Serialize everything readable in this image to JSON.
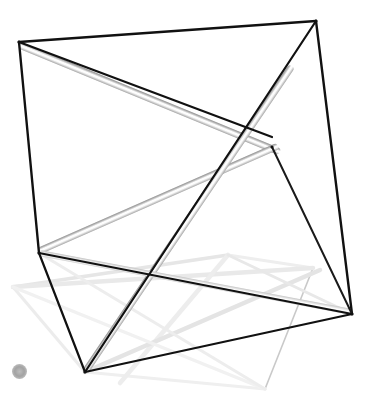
{
  "canvas": {
    "width": 381,
    "height": 417,
    "background_color": "#ffffff"
  },
  "scene": {
    "title": "3D wireframe tensegrity structure",
    "colors": {
      "edge_dark": "#111111",
      "edge_mid": "#8a8a8a",
      "strut_shadow": "#9a9a9a",
      "strut_highlight": "#ffffff",
      "edge_faint": "#e2e2e2",
      "edge_faintest": "#f0f0f0",
      "marker_gray": "#a8a8a8"
    },
    "vertices": [
      {
        "id": "v-top-left",
        "x": 19,
        "y": 42,
        "shade": "dark"
      },
      {
        "id": "v-top-right",
        "x": 316,
        "y": 21,
        "shade": "dark"
      },
      {
        "id": "v-mid-left",
        "x": 39,
        "y": 253,
        "shade": "dark"
      },
      {
        "id": "v-mid-right",
        "x": 272,
        "y": 147,
        "shade": "dark"
      },
      {
        "id": "v-bottom-left",
        "x": 85,
        "y": 372,
        "shade": "dark"
      },
      {
        "id": "v-bottom-right",
        "x": 352,
        "y": 314,
        "shade": "dark"
      },
      {
        "id": "v-ghost-left",
        "x": 13,
        "y": 287,
        "shade": "faint"
      },
      {
        "id": "v-ghost-right",
        "x": 313,
        "y": 268,
        "shade": "faint"
      },
      {
        "id": "v-ghost-bottom",
        "x": 265,
        "y": 389,
        "shade": "faint"
      },
      {
        "id": "v-ghost-upper",
        "x": 228,
        "y": 255,
        "shade": "faint"
      }
    ],
    "edges_dark": [
      {
        "id": "edge-top-rail",
        "x1": 19,
        "y1": 42,
        "x2": 316,
        "y2": 21,
        "width": 2.4,
        "color": "#111111"
      },
      {
        "id": "edge-left-post",
        "x1": 19,
        "y1": 42,
        "x2": 39,
        "y2": 253,
        "width": 2.4,
        "color": "#111111"
      },
      {
        "id": "edge-right-post",
        "x1": 316,
        "y1": 21,
        "x2": 352,
        "y2": 314,
        "width": 2.4,
        "color": "#111111"
      },
      {
        "id": "edge-top-diag-a",
        "x1": 19,
        "y1": 42,
        "x2": 272,
        "y2": 137,
        "width": 2.2,
        "color": "#111111"
      },
      {
        "id": "edge-top-diag-b",
        "x1": 316,
        "y1": 21,
        "x2": 85,
        "y2": 372,
        "width": 2.2,
        "color": "#111111"
      },
      {
        "id": "edge-left-lower",
        "x1": 39,
        "y1": 253,
        "x2": 85,
        "y2": 372,
        "width": 2.2,
        "color": "#111111"
      },
      {
        "id": "edge-bottom-rail",
        "x1": 85,
        "y1": 372,
        "x2": 352,
        "y2": 314,
        "width": 2.2,
        "color": "#111111"
      },
      {
        "id": "edge-mid-span",
        "x1": 39,
        "y1": 253,
        "x2": 352,
        "y2": 314,
        "width": 2.2,
        "color": "#111111"
      },
      {
        "id": "edge-right-fan",
        "x1": 352,
        "y1": 314,
        "x2": 272,
        "y2": 147,
        "width": 2.0,
        "color": "#1a1a1a"
      }
    ],
    "struts": [
      {
        "id": "strut-upper-right",
        "x1": 19,
        "y1": 45,
        "x2": 280,
        "y2": 152,
        "width": 7,
        "shade": "mid"
      },
      {
        "id": "strut-left-sweep",
        "x1": 39,
        "y1": 251,
        "x2": 278,
        "y2": 146,
        "width": 7,
        "shade": "mid"
      },
      {
        "id": "strut-tall-diag",
        "x1": 85,
        "y1": 372,
        "x2": 292,
        "y2": 66,
        "width": 7,
        "shade": "mid"
      },
      {
        "id": "strut-low-sweep",
        "x1": 39,
        "y1": 253,
        "x2": 352,
        "y2": 312,
        "width": 6,
        "shade": "light"
      }
    ],
    "ghost_edges": [
      {
        "id": "ghost-left-rail",
        "x1": 13,
        "y1": 287,
        "x2": 228,
        "y2": 255,
        "width": 3.5,
        "color": "#e6e6e6"
      },
      {
        "id": "ghost-left-post",
        "x1": 13,
        "y1": 287,
        "x2": 85,
        "y2": 372,
        "width": 3.0,
        "color": "#ececec"
      },
      {
        "id": "ghost-right-rail",
        "x1": 228,
        "y1": 255,
        "x2": 313,
        "y2": 268,
        "width": 3.0,
        "color": "#eeeeee"
      },
      {
        "id": "ghost-right-post",
        "x1": 313,
        "y1": 268,
        "x2": 265,
        "y2": 389,
        "width": 1.6,
        "color": "#c9c9c9"
      },
      {
        "id": "ghost-bottom-rail",
        "x1": 85,
        "y1": 372,
        "x2": 265,
        "y2": 389,
        "width": 3.0,
        "color": "#efefef"
      },
      {
        "id": "ghost-diag-a",
        "x1": 13,
        "y1": 287,
        "x2": 313,
        "y2": 268,
        "width": 4.5,
        "color": "#e9e9e9"
      },
      {
        "id": "ghost-diag-b",
        "x1": 228,
        "y1": 255,
        "x2": 120,
        "y2": 383,
        "width": 4.5,
        "color": "#ededed"
      },
      {
        "id": "ghost-diag-c",
        "x1": 85,
        "y1": 372,
        "x2": 320,
        "y2": 270,
        "width": 4.5,
        "color": "#e4e4e4"
      },
      {
        "id": "ghost-diag-d",
        "x1": 13,
        "y1": 287,
        "x2": 265,
        "y2": 389,
        "width": 3.5,
        "color": "#f1f1f1"
      },
      {
        "id": "ghost-diag-e",
        "x1": 39,
        "y1": 253,
        "x2": 265,
        "y2": 389,
        "width": 3.0,
        "color": "#ededed"
      },
      {
        "id": "ghost-diag-f",
        "x1": 228,
        "y1": 255,
        "x2": 352,
        "y2": 314,
        "width": 3.0,
        "color": "#e8e8e8"
      }
    ],
    "origin_marker": {
      "id": "origin-marker",
      "x": 12,
      "y": 364,
      "size": 15,
      "color": "#a8a8a8"
    }
  }
}
